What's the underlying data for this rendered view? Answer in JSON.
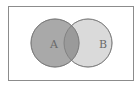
{
  "diagram": {
    "type": "venn",
    "sets": [
      {
        "label": "A",
        "fill": "#a9a9a9",
        "stroke": "#7a7a7a"
      },
      {
        "label": "B",
        "fill": "#dadada",
        "stroke": "#8a8a8a"
      }
    ],
    "intersection_fill": "#9a9a9a",
    "frame_stroke": "#8c8c8c",
    "background": "#ffffff"
  }
}
